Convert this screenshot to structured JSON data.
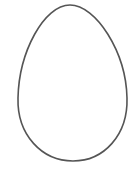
{
  "image": {
    "subject": "egg outline",
    "background_color": "#ffffff",
    "stroke_color": "#555555",
    "fill_color": "#ffffff"
  }
}
